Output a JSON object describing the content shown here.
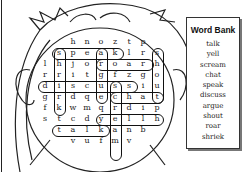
{
  "word_bank": {
    "title": "Word Bank",
    "words": [
      "talk",
      "yell",
      "scream",
      "chat",
      "speak",
      "discuss",
      "argue",
      "shout",
      "roar",
      "shriek"
    ]
  },
  "grid": {
    "rows": [
      [
        "",
        "",
        "h",
        "n",
        "o",
        "z",
        "t",
        "p",
        ""
      ],
      [
        "",
        "s",
        "p",
        "e",
        "a",
        "k",
        "l",
        "r",
        "s"
      ],
      [
        "l",
        "h",
        "j",
        "o",
        "r",
        "o",
        "a",
        "r",
        "h"
      ],
      [
        "r",
        "r",
        "i",
        "t",
        "g",
        "f",
        "z",
        "g",
        "o"
      ],
      [
        "d",
        "i",
        "s",
        "c",
        "u",
        "s",
        "s",
        "i",
        "u"
      ],
      [
        "g",
        "r",
        "d",
        "q",
        "e",
        "c",
        "h",
        "a",
        "t"
      ],
      [
        "f",
        "k",
        "w",
        "m",
        "q",
        "r",
        "d",
        "i",
        "p"
      ],
      [
        "s",
        "t",
        "c",
        "d",
        "y",
        "e",
        "l",
        "l",
        "h"
      ],
      [
        "",
        "t",
        "a",
        "l",
        "k",
        "a",
        "n",
        "b",
        ""
      ],
      [
        "",
        "",
        "v",
        "u",
        "f",
        "m",
        "v",
        "",
        ""
      ]
    ]
  }
}
